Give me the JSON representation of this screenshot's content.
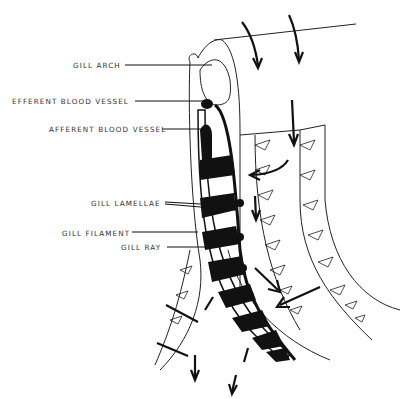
{
  "diagram": {
    "labels": [
      {
        "id": "gill_arch",
        "text": "GILL ARCH"
      },
      {
        "id": "efferent",
        "text": "EFFERENT BLOOD VESSEL"
      },
      {
        "id": "afferent",
        "text": "AFFERENT BLOOD VESSEL"
      },
      {
        "id": "lamellae",
        "text": "GILL LAMELLAE"
      },
      {
        "id": "filament",
        "text": "GILL FILAMENT"
      },
      {
        "id": "ray",
        "text": "GILL RAY"
      }
    ],
    "colors": {
      "ink": "#1a1a1a",
      "background": "#ffffff"
    }
  }
}
